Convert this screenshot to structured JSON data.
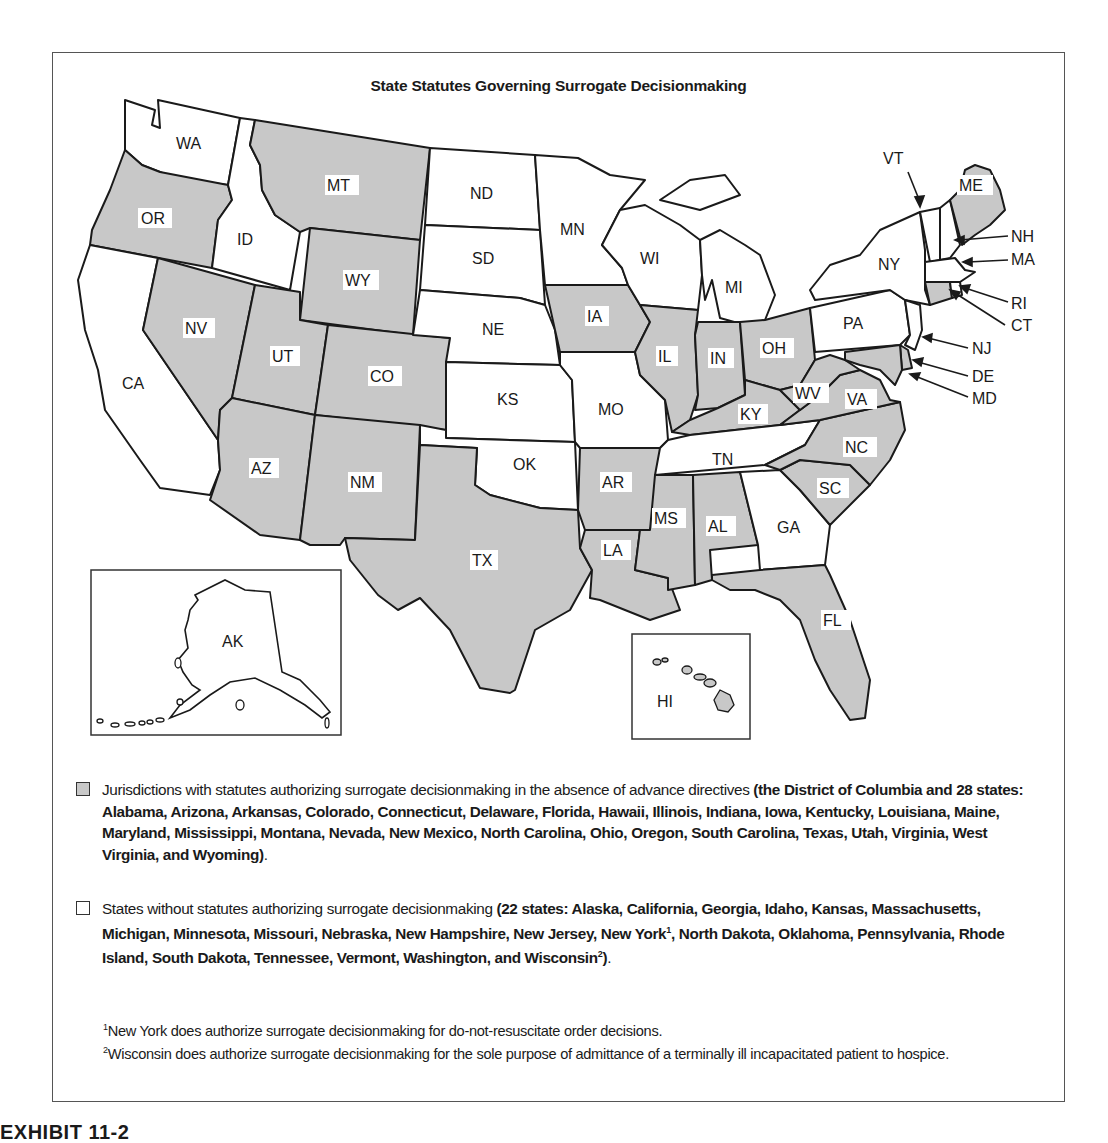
{
  "figure": {
    "title": "State Statutes Governing Surrogate Decisionmaking",
    "colors": {
      "with_statute_fill": "#c8c8c8",
      "without_statute_fill": "#ffffff",
      "border": "#1a1a1a"
    },
    "states": [
      {
        "abbr": "WA",
        "shaded": false
      },
      {
        "abbr": "OR",
        "shaded": true
      },
      {
        "abbr": "CA",
        "shaded": false
      },
      {
        "abbr": "ID",
        "shaded": false
      },
      {
        "abbr": "NV",
        "shaded": true
      },
      {
        "abbr": "MT",
        "shaded": true
      },
      {
        "abbr": "WY",
        "shaded": true
      },
      {
        "abbr": "UT",
        "shaded": true
      },
      {
        "abbr": "CO",
        "shaded": true
      },
      {
        "abbr": "AZ",
        "shaded": true
      },
      {
        "abbr": "NM",
        "shaded": true
      },
      {
        "abbr": "ND",
        "shaded": false
      },
      {
        "abbr": "SD",
        "shaded": false
      },
      {
        "abbr": "NE",
        "shaded": false
      },
      {
        "abbr": "KS",
        "shaded": false
      },
      {
        "abbr": "OK",
        "shaded": false
      },
      {
        "abbr": "TX",
        "shaded": true
      },
      {
        "abbr": "MN",
        "shaded": false
      },
      {
        "abbr": "IA",
        "shaded": true
      },
      {
        "abbr": "MO",
        "shaded": false
      },
      {
        "abbr": "AR",
        "shaded": true
      },
      {
        "abbr": "LA",
        "shaded": true
      },
      {
        "abbr": "WI",
        "shaded": false
      },
      {
        "abbr": "IL",
        "shaded": true
      },
      {
        "abbr": "MI",
        "shaded": false
      },
      {
        "abbr": "IN",
        "shaded": true
      },
      {
        "abbr": "OH",
        "shaded": true
      },
      {
        "abbr": "KY",
        "shaded": true
      },
      {
        "abbr": "TN",
        "shaded": false
      },
      {
        "abbr": "MS",
        "shaded": true
      },
      {
        "abbr": "AL",
        "shaded": true
      },
      {
        "abbr": "GA",
        "shaded": false
      },
      {
        "abbr": "FL",
        "shaded": true
      },
      {
        "abbr": "SC",
        "shaded": true
      },
      {
        "abbr": "NC",
        "shaded": true
      },
      {
        "abbr": "VA",
        "shaded": true
      },
      {
        "abbr": "WV",
        "shaded": true
      },
      {
        "abbr": "PA",
        "shaded": false
      },
      {
        "abbr": "NY",
        "shaded": false
      },
      {
        "abbr": "VT",
        "shaded": false
      },
      {
        "abbr": "NH",
        "shaded": false
      },
      {
        "abbr": "ME",
        "shaded": true
      },
      {
        "abbr": "MA",
        "shaded": false
      },
      {
        "abbr": "RI",
        "shaded": false
      },
      {
        "abbr": "CT",
        "shaded": true
      },
      {
        "abbr": "NJ",
        "shaded": false
      },
      {
        "abbr": "DE",
        "shaded": true
      },
      {
        "abbr": "MD",
        "shaded": true
      },
      {
        "abbr": "AK",
        "shaded": false
      },
      {
        "abbr": "HI",
        "shaded": true
      }
    ],
    "labels": {
      "WA": "WA",
      "OR": "OR",
      "CA": "CA",
      "ID": "ID",
      "NV": "NV",
      "MT": "MT",
      "WY": "WY",
      "UT": "UT",
      "CO": "CO",
      "AZ": "AZ",
      "NM": "NM",
      "ND": "ND",
      "SD": "SD",
      "NE": "NE",
      "KS": "KS",
      "OK": "OK",
      "TX": "TX",
      "MN": "MN",
      "IA": "IA",
      "MO": "MO",
      "AR": "AR",
      "LA": "LA",
      "WI": "WI",
      "IL": "IL",
      "MI": "MI",
      "IN": "IN",
      "OH": "OH",
      "KY": "KY",
      "TN": "TN",
      "MS": "MS",
      "AL": "AL",
      "GA": "GA",
      "FL": "FL",
      "SC": "SC",
      "NC": "NC",
      "VA": "VA",
      "WV": "WV",
      "PA": "PA",
      "NY": "NY",
      "VT": "VT",
      "NH": "NH",
      "ME": "ME",
      "MA": "MA",
      "RI": "RI",
      "CT": "CT",
      "NJ": "NJ",
      "DE": "DE",
      "MD": "MD",
      "AK": "AK",
      "HI": "HI"
    },
    "callouts": [
      "VT",
      "NH",
      "MA",
      "RI",
      "CT",
      "NJ",
      "DE",
      "MD"
    ],
    "insets": [
      "AK",
      "HI"
    ]
  },
  "legend": {
    "shaded": {
      "intro": "Jurisdictions with statutes authorizing surrogate decisionmaking in the absence of advance directives ",
      "list": "(the District of Columbia and 28 states: Alabama, Arizona, Arkansas, Colorado, Connecticut, Delaware, Florida, Hawaii, Illinois, Indiana, Iowa, Kentucky, Louisiana, Maine, Maryland, Mississippi, Montana, Nevada, New Mexico, North Carolina, Ohio, Oregon, South Carolina, Texas, Utah, Virginia, West Virginia, and Wyoming)",
      "end": "."
    },
    "unshaded": {
      "intro": "States without statutes authorizing surrogate decisionmaking ",
      "list_a": "(22 states: Alaska, California, Georgia, Idaho, Kansas, Massachusetts, Michigan, Minnesota, Missouri, Nebraska, New Hampshire, New Jersey, New York",
      "sup1": "1",
      "list_b": ", North Dakota, Oklahoma, Pennsylvania, Rhode Island, South Dakota, Tennessee, Vermont, Washington, and Wisconsin",
      "sup2": "2",
      "list_c": ")",
      "end": "."
    }
  },
  "footnotes": [
    {
      "mark": "1",
      "text": "New York does authorize surrogate decisionmaking for do-not-resuscitate order decisions."
    },
    {
      "mark": "2",
      "text": "Wisconsin does authorize surrogate decisionmaking for the sole purpose of admittance of a terminally ill incapacitated patient to hospice."
    }
  ],
  "caption": "EXHIBIT 11-2"
}
